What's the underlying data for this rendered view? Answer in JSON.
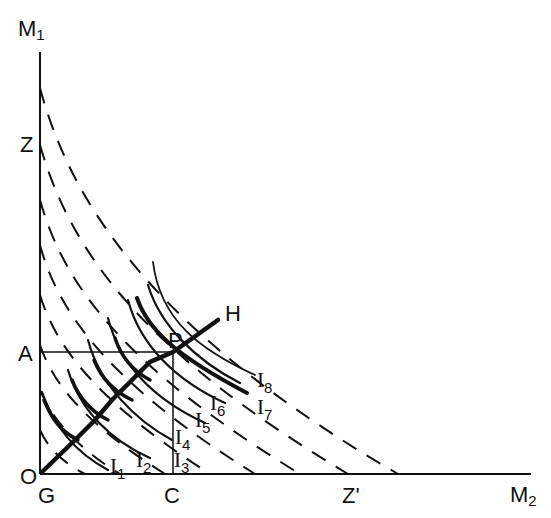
{
  "figure": {
    "type": "economics-indifference-diagram",
    "axes": {
      "y_label": "M",
      "y_label_sub": "1",
      "x_label": "M",
      "x_label_sub": "2",
      "origin_label_O": "O",
      "origin_label_G": "G"
    },
    "points": {
      "A": "A",
      "Z": "Z",
      "C": "C",
      "Z_prime": "Z'",
      "P": "P",
      "H": "H"
    },
    "indifference_labels": [
      {
        "base": "I",
        "sub": "1"
      },
      {
        "base": "I",
        "sub": "2"
      },
      {
        "base": "I",
        "sub": "3"
      },
      {
        "base": "I",
        "sub": "4"
      },
      {
        "base": "I",
        "sub": "5"
      },
      {
        "base": "I",
        "sub": "6"
      },
      {
        "base": "I",
        "sub": "7"
      },
      {
        "base": "I",
        "sub": "8"
      }
    ],
    "colors": {
      "ink": "#111111",
      "background": "#ffffff"
    }
  }
}
